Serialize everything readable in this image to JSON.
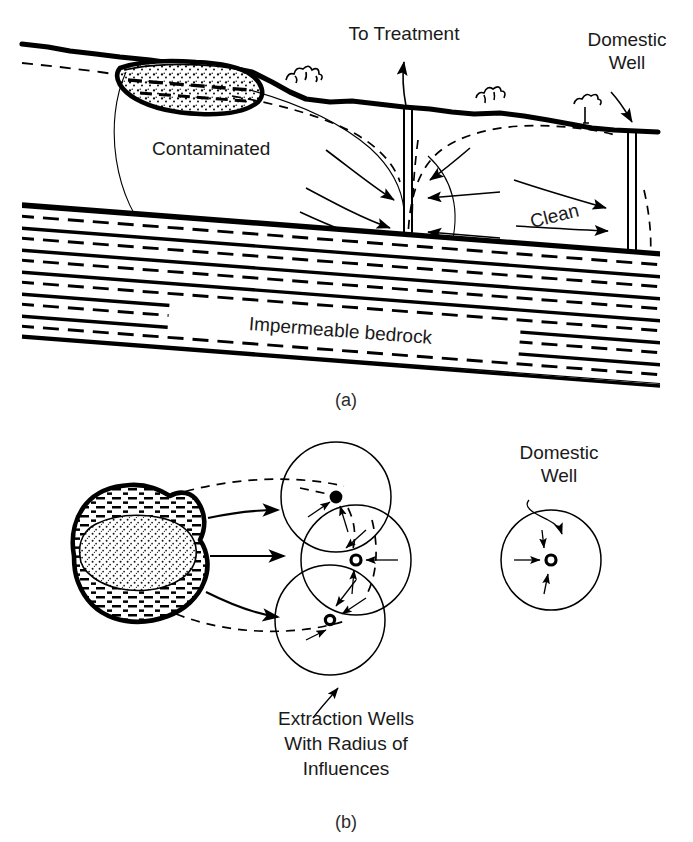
{
  "figure": {
    "title_context": "Pump-and-treat groundwater remediation schematic",
    "panels": [
      {
        "id": "a",
        "caption": "(a)",
        "view": "cross-section",
        "labels": [
          {
            "name": "to-treatment",
            "text": "To Treatment"
          },
          {
            "name": "domestic-well",
            "text": "Domestic\nWell",
            "line1": "Domestic",
            "line2": "Well"
          },
          {
            "name": "contaminated",
            "text": "Contaminated"
          },
          {
            "name": "clean",
            "text": "Clean"
          },
          {
            "name": "impermeable-bedrock",
            "text": "Impermeable bedrock"
          }
        ]
      },
      {
        "id": "b",
        "caption": "(b)",
        "view": "plan",
        "labels": [
          {
            "name": "domestic-well",
            "line1": "Domestic",
            "line2": "Well"
          },
          {
            "name": "extraction-wells",
            "line1": "Extraction Wells",
            "line2": "With Radius of",
            "line3": "Influences"
          }
        ]
      }
    ],
    "panel_a": {
      "caption": "(a)",
      "to_treatment_label": "To Treatment",
      "domestic_well_line1": "Domestic",
      "domestic_well_line2": "Well",
      "contaminated_label": "Contaminated",
      "clean_label": "Clean",
      "bedrock_label": "Impermeable bedrock"
    },
    "panel_b": {
      "caption": "(b)",
      "domestic_well_line1": "Domestic",
      "domestic_well_line2": "Well",
      "extraction_line1": "Extraction Wells",
      "extraction_line2": "With Radius of",
      "extraction_line3": "Influences"
    },
    "colors": {
      "ink": "#000000",
      "text": "#1a1a1a",
      "caption": "#2b2b2b",
      "background": "#ffffff"
    },
    "icon_names": [
      "ground-surface-icon",
      "water-table-dashed-icon",
      "contaminant-plume-icon",
      "extraction-well-pipe-icon",
      "domestic-well-pipe-icon",
      "flow-arrow-icon",
      "drawdown-cone-icon",
      "capture-zone-curve-icon",
      "bedrock-hatch-icon",
      "shrub-icon",
      "radius-of-influence-circle-icon",
      "well-point-icon",
      "leader-line-icon"
    ]
  }
}
